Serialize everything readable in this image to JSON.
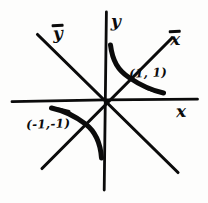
{
  "figure": {
    "background_color": "#fdfdfc",
    "ink_color": "#0b0b0b",
    "width": 208,
    "height": 203
  },
  "axes": {
    "origin": {
      "x": 105,
      "y": 100
    },
    "horizontal": {
      "name": "x-axis",
      "label": "x",
      "overbar": false,
      "x1": 12,
      "y1": 101,
      "x2": 197,
      "y2": 99
    },
    "vertical": {
      "name": "y-axis",
      "label": "y",
      "overbar": false,
      "x1": 106,
      "y1": 12,
      "x2": 104,
      "y2": 190
    },
    "rotated_rising": {
      "name": "x-bar-axis",
      "label": "x",
      "overbar": true,
      "x1": 42,
      "y1": 168,
      "x2": 172,
      "y2": 38
    },
    "rotated_falling": {
      "name": "y-bar-axis",
      "label": "y",
      "overbar": true,
      "x1": 37,
      "y1": 35,
      "x2": 178,
      "y2": 172
    }
  },
  "labels": {
    "y_bar": "y",
    "y": "y",
    "x_bar": "x",
    "x": "x",
    "point_upper": "(1, 1)",
    "point_lower": "(-1,-1)"
  },
  "chart_data": {
    "type": "line",
    "xlabel": "x",
    "ylabel": "y",
    "equation": "y = 1/x",
    "grid": false,
    "legend": false,
    "xlim": [
      -3,
      3
    ],
    "ylim": [
      -3,
      3
    ],
    "annotations": [
      {
        "text": "(1, 1)",
        "x": 1,
        "y": 1
      },
      {
        "text": "(-1,-1)",
        "x": -1,
        "y": -1
      },
      {
        "text": "x",
        "overbar": true,
        "note": "rotated axis label, upper right"
      },
      {
        "text": "y",
        "overbar": true,
        "note": "rotated axis label, upper left"
      },
      {
        "text": "x",
        "overbar": false,
        "note": "horizontal axis label, right"
      },
      {
        "text": "y",
        "overbar": false,
        "note": "vertical axis label, top"
      }
    ],
    "series": [
      {
        "name": "branch-upper-right",
        "x": [
          0.33,
          0.4,
          0.5,
          0.62,
          0.78,
          1.0,
          1.3,
          1.7,
          2.2,
          2.8,
          3.3
        ],
        "y": [
          3.0,
          2.5,
          2.0,
          1.6,
          1.28,
          1.0,
          0.77,
          0.59,
          0.45,
          0.36,
          0.3
        ]
      },
      {
        "name": "branch-lower-left",
        "x": [
          -3.3,
          -2.8,
          -2.2,
          -1.7,
          -1.3,
          -1.0,
          -0.78,
          -0.62,
          -0.5,
          -0.4,
          -0.33
        ],
        "y": [
          -0.3,
          -0.36,
          -0.45,
          -0.59,
          -0.77,
          -1.0,
          -1.28,
          -1.6,
          -2.0,
          -2.5,
          -3.0
        ]
      },
      {
        "name": "asymptote-x-bar",
        "x": [
          -2.2,
          2.2
        ],
        "y": [
          -2.2,
          2.2
        ]
      },
      {
        "name": "asymptote-y-bar",
        "x": [
          -2.3,
          2.3
        ],
        "y": [
          2.3,
          -2.3
        ]
      }
    ]
  }
}
